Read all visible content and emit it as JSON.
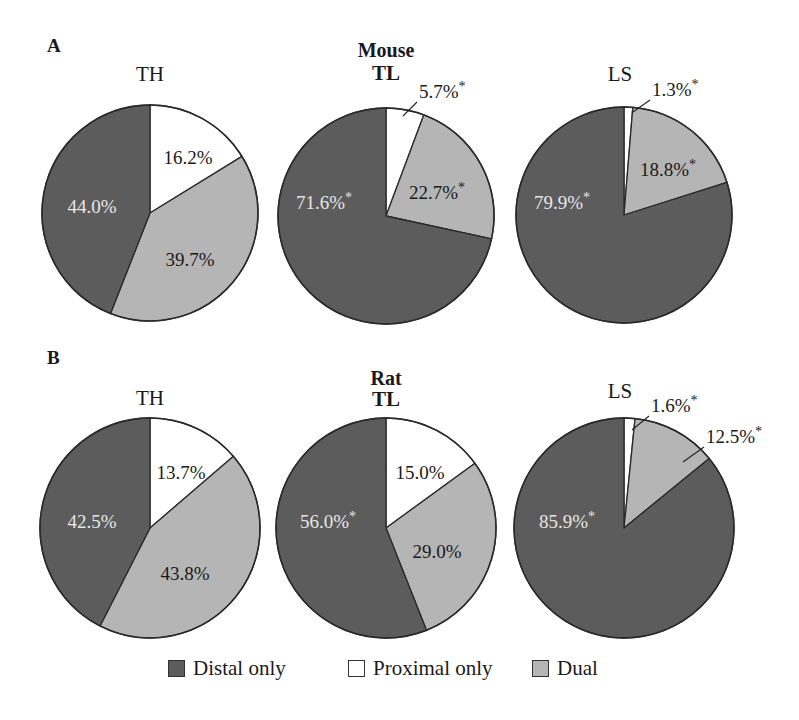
{
  "colors": {
    "distal": "#5c5c5c",
    "proximal": "#ffffff",
    "dual": "#b5b5b5",
    "stroke": "#2a2a2a",
    "label_dark": "#1a1a1a",
    "label_light": "#e6e6e6"
  },
  "panels": [
    {
      "letter": "A",
      "letter_pos": [
        47,
        52
      ],
      "species": "Mouse",
      "species_pos": [
        386,
        57
      ]
    },
    {
      "letter": "B",
      "letter_pos": [
        47,
        364
      ],
      "species": "Rat",
      "species_pos": [
        386,
        385
      ]
    }
  ],
  "legend": [
    {
      "key": "distal",
      "label": "Distal only",
      "x": 168
    },
    {
      "key": "proximal",
      "label": "Proximal only",
      "x": 348
    },
    {
      "key": "dual",
      "label": "Dual",
      "x": 532
    }
  ],
  "chart_data": [
    {
      "type": "pie",
      "panel": "A",
      "species": "Mouse",
      "title": "TH",
      "title_bold": false,
      "center": [
        150,
        213
      ],
      "radius": 108,
      "title_pos": [
        150,
        81
      ],
      "slices": [
        {
          "name": "Proximal only",
          "key": "proximal",
          "value": 16.2,
          "label": "16.2%",
          "significant": false,
          "label_pos": [
            188,
            160
          ],
          "label_color": "dark"
        },
        {
          "name": "Dual",
          "key": "dual",
          "value": 39.7,
          "label": "39.7%",
          "significant": false,
          "label_pos": [
            190,
            262
          ],
          "label_color": "dark"
        },
        {
          "name": "Distal only",
          "key": "distal",
          "value": 44.0,
          "label": "44.0%",
          "significant": false,
          "label_pos": [
            92,
            209
          ],
          "label_color": "light"
        }
      ]
    },
    {
      "type": "pie",
      "panel": "A",
      "species": "Mouse",
      "title": "TL",
      "title_bold": true,
      "center": [
        386,
        216
      ],
      "radius": 108,
      "title_pos": [
        386,
        80
      ],
      "slices": [
        {
          "name": "Proximal only",
          "key": "proximal",
          "value": 5.7,
          "label": "5.7%*",
          "significant": true,
          "label_pos": [
            424,
            100
          ],
          "label_color": "dark",
          "leader": [
            [
              417,
              102
            ],
            [
              403,
              116
            ]
          ]
        },
        {
          "name": "Dual",
          "key": "dual",
          "value": 22.7,
          "label": "22.7%*",
          "significant": true,
          "label_pos": [
            437,
            195
          ],
          "label_color": "dark"
        },
        {
          "name": "Distal only",
          "key": "distal",
          "value": 71.6,
          "label": "71.6%*",
          "significant": true,
          "label_pos": [
            324,
            205
          ],
          "label_color": "light"
        }
      ]
    },
    {
      "type": "pie",
      "panel": "A",
      "species": "Mouse",
      "title": "LS",
      "title_bold": false,
      "center": [
        624,
        215
      ],
      "radius": 108,
      "title_pos": [
        620,
        81
      ],
      "slices": [
        {
          "name": "Proximal only",
          "key": "proximal",
          "value": 1.3,
          "label": "1.3%*",
          "significant": true,
          "label_pos": [
            662,
            100
          ],
          "label_color": "dark",
          "leader": [
            [
              650,
              100
            ],
            [
              633,
              112
            ]
          ]
        },
        {
          "name": "Dual",
          "key": "dual",
          "value": 18.8,
          "label": "18.8%*",
          "significant": true,
          "label_pos": [
            668,
            172
          ],
          "label_color": "dark"
        },
        {
          "name": "Distal only",
          "key": "distal",
          "value": 79.9,
          "label": "79.9%*",
          "significant": true,
          "label_pos": [
            562,
            205
          ],
          "label_color": "light"
        }
      ]
    },
    {
      "type": "pie",
      "panel": "B",
      "species": "Rat",
      "title": "TH",
      "title_bold": false,
      "center": [
        150,
        528
      ],
      "radius": 110,
      "title_pos": [
        150,
        405
      ],
      "slices": [
        {
          "name": "Proximal only",
          "key": "proximal",
          "value": 13.7,
          "label": "13.7%",
          "significant": false,
          "label_pos": [
            181,
            475
          ],
          "label_color": "dark"
        },
        {
          "name": "Dual",
          "key": "dual",
          "value": 43.8,
          "label": "43.8%",
          "significant": false,
          "label_pos": [
            185,
            576
          ],
          "label_color": "dark"
        },
        {
          "name": "Distal only",
          "key": "distal",
          "value": 42.5,
          "label": "42.5%",
          "significant": false,
          "label_pos": [
            92,
            524
          ],
          "label_color": "light"
        }
      ]
    },
    {
      "type": "pie",
      "panel": "B",
      "species": "Rat",
      "title": "TL",
      "title_bold": true,
      "center": [
        386,
        528
      ],
      "radius": 110,
      "title_pos": [
        386,
        406
      ],
      "slices": [
        {
          "name": "Proximal only",
          "key": "proximal",
          "value": 15.0,
          "label": "15.0%",
          "significant": false,
          "label_pos": [
            420,
            475
          ],
          "label_color": "dark"
        },
        {
          "name": "Dual",
          "key": "dual",
          "value": 29.0,
          "label": "29.0%",
          "significant": false,
          "label_pos": [
            437,
            554
          ],
          "label_color": "dark"
        },
        {
          "name": "Distal only",
          "key": "distal",
          "value": 56.0,
          "label": "56.0%*",
          "significant": true,
          "label_pos": [
            328,
            524
          ],
          "label_color": "light"
        }
      ]
    },
    {
      "type": "pie",
      "panel": "B",
      "species": "Rat",
      "title": "LS",
      "title_bold": false,
      "center": [
        624,
        528
      ],
      "radius": 110,
      "title_pos": [
        620,
        398
      ],
      "slices": [
        {
          "name": "Proximal only",
          "key": "proximal",
          "value": 1.6,
          "label": "1.6%*",
          "significant": true,
          "label_pos": [
            660,
            415
          ],
          "label_color": "dark",
          "leader": [
            [
              649,
              416
            ],
            [
              632,
              430
            ]
          ]
        },
        {
          "name": "Dual",
          "key": "dual",
          "value": 12.5,
          "label": "12.5%*",
          "significant": true,
          "label_pos": [
            712,
            446
          ],
          "label_color": "dark",
          "leader": [
            [
              704,
              447
            ],
            [
              683,
              462
            ]
          ]
        },
        {
          "name": "Distal only",
          "key": "distal",
          "value": 85.9,
          "label": "85.9%*",
          "significant": true,
          "label_pos": [
            567,
            524
          ],
          "label_color": "light"
        }
      ]
    }
  ]
}
